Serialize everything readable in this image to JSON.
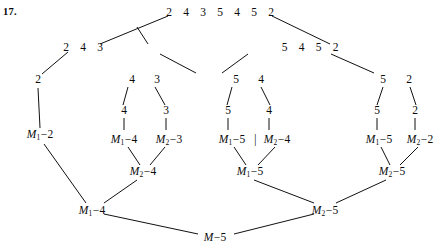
{
  "figure": {
    "exercise_number": "17.",
    "levels": {
      "top_sequence": [
        "2",
        "4",
        "3",
        "5",
        "4",
        "5",
        "2"
      ],
      "left_branch_sequence": [
        "2",
        "4",
        "3"
      ],
      "right_branch_sequence": [
        "5",
        "4",
        "5",
        "2"
      ],
      "level3": [
        "2",
        "4",
        "3",
        "5",
        "4",
        "5",
        "2"
      ],
      "level4": [
        "4",
        "3",
        "5",
        "4",
        "5",
        "2"
      ]
    },
    "nodes": [
      {
        "id": "top",
        "text": "2 4 3 5 4 5 2",
        "x": 220,
        "y": 12,
        "kind": "sequence"
      },
      {
        "id": "l1",
        "text": "2 4 3",
        "x": 83,
        "y": 47,
        "kind": "sequence"
      },
      {
        "id": "r1",
        "text": "5 4 5 2",
        "x": 310,
        "y": 47,
        "kind": "sequence"
      },
      {
        "id": "l2a",
        "text": "2",
        "x": 38,
        "y": 80,
        "kind": "digit"
      },
      {
        "id": "l2b",
        "text": "4",
        "x": 132,
        "y": 80,
        "kind": "digit"
      },
      {
        "id": "l2c",
        "text": "3",
        "x": 157,
        "y": 80,
        "kind": "digit"
      },
      {
        "id": "r2a",
        "text": "5",
        "x": 236,
        "y": 80,
        "kind": "digit"
      },
      {
        "id": "r2b",
        "text": "4",
        "x": 261,
        "y": 80,
        "kind": "digit"
      },
      {
        "id": "r2c",
        "text": "5",
        "x": 383,
        "y": 80,
        "kind": "digit"
      },
      {
        "id": "r2d",
        "text": "2",
        "x": 409,
        "y": 80,
        "kind": "digit"
      },
      {
        "id": "l3b",
        "text": "4",
        "x": 124,
        "y": 111,
        "kind": "digit"
      },
      {
        "id": "l3c",
        "text": "3",
        "x": 166,
        "y": 111,
        "kind": "digit"
      },
      {
        "id": "r3a",
        "text": "5",
        "x": 228,
        "y": 111,
        "kind": "digit"
      },
      {
        "id": "r3b",
        "text": "4",
        "x": 269,
        "y": 111,
        "kind": "digit"
      },
      {
        "id": "r3c",
        "text": "5",
        "x": 377,
        "y": 111,
        "kind": "digit"
      },
      {
        "id": "r3d",
        "text": "2",
        "x": 415,
        "y": 111,
        "kind": "digit"
      },
      {
        "id": "m_l_2",
        "text": "M₁−2",
        "x": 40,
        "y": 135,
        "kind": "label",
        "m": "M",
        "sub": "1",
        "val": "2"
      },
      {
        "id": "m_l3_4",
        "text": "M₁−4",
        "x": 124,
        "y": 140,
        "kind": "label",
        "m": "M",
        "sub": "1",
        "val": "4"
      },
      {
        "id": "m_l3_3",
        "text": "M₂−3",
        "x": 169,
        "y": 140,
        "kind": "label",
        "m": "M",
        "sub": "2",
        "val": "3"
      },
      {
        "id": "m_r3_5",
        "text": "M₁−5",
        "x": 232,
        "y": 140,
        "kind": "label",
        "m": "M",
        "sub": "1",
        "val": "5"
      },
      {
        "id": "m_r3_4",
        "text": "M₂−4",
        "x": 277,
        "y": 140,
        "kind": "label",
        "m": "M",
        "sub": "2",
        "val": "4"
      },
      {
        "id": "m_r4_5",
        "text": "M₁−5",
        "x": 379,
        "y": 140,
        "kind": "label",
        "m": "M",
        "sub": "1",
        "val": "5"
      },
      {
        "id": "m_r4_2",
        "text": "M₂−2",
        "x": 420,
        "y": 140,
        "kind": "label",
        "m": "M",
        "sub": "2",
        "val": "2"
      },
      {
        "id": "m_mid_l",
        "text": "M₂−4",
        "x": 143,
        "y": 172,
        "kind": "label",
        "m": "M",
        "sub": "2",
        "val": "4"
      },
      {
        "id": "m_mid_c",
        "text": "M₁−5",
        "x": 250,
        "y": 172,
        "kind": "label",
        "m": "M",
        "sub": "1",
        "val": "5"
      },
      {
        "id": "m_mid_r",
        "text": "M₂−5",
        "x": 392,
        "y": 172,
        "kind": "label",
        "m": "M",
        "sub": "2",
        "val": "5"
      },
      {
        "id": "m_bot_l",
        "text": "M₁−4",
        "x": 92,
        "y": 211,
        "kind": "label",
        "m": "M",
        "sub": "1",
        "val": "4"
      },
      {
        "id": "m_bot_r",
        "text": "M₂−5",
        "x": 325,
        "y": 211,
        "kind": "label",
        "m": "M",
        "sub": "2",
        "val": "5"
      },
      {
        "id": "m_root",
        "text": "M−5",
        "x": 215,
        "y": 238,
        "kind": "label",
        "m": "M",
        "sub": "",
        "val": "5"
      }
    ],
    "separator_bar": "|",
    "edges": [
      [
        168,
        16,
        100,
        44
      ],
      [
        272,
        16,
        330,
        44
      ],
      [
        68,
        52,
        42,
        74
      ],
      [
        148,
        44,
        137,
        27
      ],
      [
        160,
        54,
        196,
        73
      ],
      [
        248,
        54,
        222,
        73
      ],
      [
        331,
        54,
        374,
        73
      ],
      [
        232,
        87,
        227,
        105
      ],
      [
        261,
        87,
        270,
        105
      ],
      [
        383,
        87,
        377,
        105
      ],
      [
        410,
        87,
        416,
        105
      ],
      [
        128,
        87,
        123,
        105
      ],
      [
        155,
        87,
        165,
        105
      ],
      [
        124,
        118,
        124,
        130
      ],
      [
        166,
        118,
        166,
        130
      ],
      [
        228,
        118,
        228,
        130
      ],
      [
        269,
        118,
        269,
        130
      ],
      [
        377,
        118,
        377,
        130
      ],
      [
        415,
        118,
        415,
        130
      ],
      [
        38,
        88,
        40,
        128
      ],
      [
        128,
        147,
        140,
        165
      ],
      [
        165,
        147,
        150,
        165
      ],
      [
        234,
        147,
        246,
        165
      ],
      [
        275,
        147,
        258,
        165
      ],
      [
        381,
        147,
        390,
        165
      ],
      [
        418,
        147,
        400,
        165
      ],
      [
        44,
        144,
        86,
        203
      ],
      [
        137,
        180,
        104,
        203
      ],
      [
        254,
        180,
        314,
        203
      ],
      [
        386,
        180,
        336,
        203
      ],
      [
        104,
        214,
        198,
        234
      ],
      [
        234,
        234,
        314,
        214
      ]
    ]
  }
}
